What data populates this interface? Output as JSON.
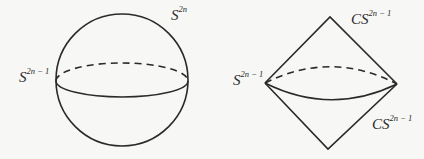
{
  "figures": {
    "sphere": {
      "name": "sphere",
      "top_label": {
        "base": "S",
        "sup": "2n"
      },
      "equator_label": {
        "base": "S",
        "sup": "2n − 1"
      }
    },
    "suspension": {
      "name": "double cone",
      "equator_label": {
        "base": "S",
        "sup": "2n − 1"
      },
      "upper_cone_label": {
        "base": "CS",
        "sup": "2n − 1"
      },
      "lower_cone_label": {
        "base": "CS",
        "sup": "2n − 1"
      }
    }
  },
  "style": {
    "stroke_color": "#2a2a2a",
    "background": "#f7f7f5"
  }
}
